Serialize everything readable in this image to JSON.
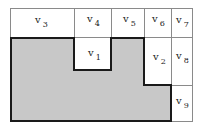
{
  "diagram": {
    "cells": [
      {
        "id": "v3",
        "label": "v",
        "sub": "3"
      },
      {
        "id": "v4",
        "label": "v",
        "sub": "4"
      },
      {
        "id": "v5",
        "label": "v",
        "sub": "5"
      },
      {
        "id": "v6",
        "label": "v",
        "sub": "6"
      },
      {
        "id": "v7",
        "label": "v",
        "sub": "7"
      },
      {
        "id": "v1",
        "label": "v",
        "sub": "1"
      },
      {
        "id": "v2",
        "label": "v",
        "sub": "2"
      },
      {
        "id": "v8",
        "label": "v",
        "sub": "8"
      },
      {
        "id": "v9",
        "label": "v",
        "sub": "9"
      }
    ],
    "colors": {
      "shaded": "#c8c8c8",
      "border": "#8a8a8a",
      "outline": "#1a1a1a"
    }
  }
}
